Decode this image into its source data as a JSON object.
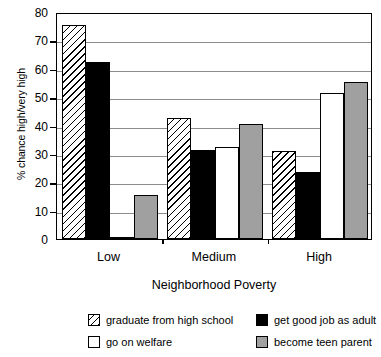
{
  "chart_data": {
    "type": "bar",
    "title": "",
    "xlabel": "Neighborhood Poverty",
    "ylabel": "% chance high/very high",
    "categories": [
      "Low",
      "Medium",
      "High"
    ],
    "ylim": [
      0,
      80
    ],
    "yticks": [
      0,
      10,
      20,
      30,
      40,
      50,
      60,
      70,
      80
    ],
    "ytick_labels": [
      "0",
      "10",
      "20",
      "30",
      "40",
      "50",
      "60",
      "70",
      "80"
    ],
    "grid": true,
    "legend_position": "bottom",
    "series": [
      {
        "name": "graduate from high school",
        "pattern": "hatch",
        "color": "#ffffff",
        "values": [
          75.5,
          42.5,
          31.0
        ]
      },
      {
        "name": "get good job as adult",
        "pattern": "solid-black",
        "color": "#000000",
        "values": [
          62.5,
          31.5,
          23.5
        ]
      },
      {
        "name": "go on welfare",
        "pattern": "white",
        "color": "#ffffff",
        "values": [
          0.4,
          32.5,
          51.5
        ]
      },
      {
        "name": "become teen parent",
        "pattern": "gray",
        "color": "#a0a0a0",
        "values": [
          15.5,
          40.5,
          55.5
        ]
      }
    ]
  },
  "legend": {
    "items": [
      {
        "label": "graduate from high school",
        "pattern": "hatch"
      },
      {
        "label": "get good job as adult",
        "pattern": "solid-black"
      },
      {
        "label": "go on welfare",
        "pattern": "white"
      },
      {
        "label": "become teen parent",
        "pattern": "gray"
      }
    ]
  }
}
